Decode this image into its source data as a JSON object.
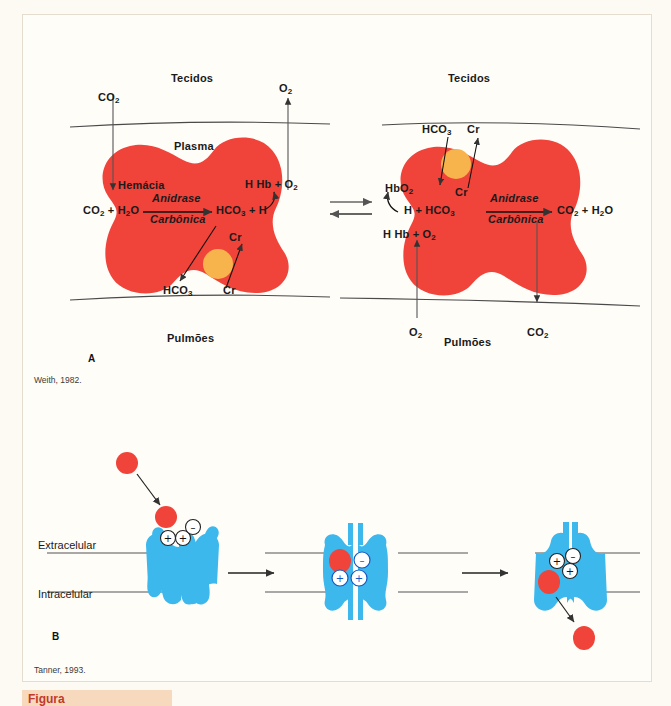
{
  "figure": {
    "background_color": "#fdfaf4",
    "panel_background": "#fffdf8",
    "rbc_color": "#f0433a",
    "band3_color": "#3db8ed",
    "carrier_color": "#f8b44c",
    "line_color": "#4a4a4a"
  },
  "panel_a": {
    "letter": "A",
    "source": "Weith, 1982.",
    "left": {
      "top_compartment": "Tecidos",
      "bottom_compartment": "Pulmões",
      "plasma_label": "Plasma",
      "cell_label": "Hemácia",
      "in_gas": "CO",
      "in_gas_sub": "2",
      "out_gas": "O",
      "out_gas_sub": "2",
      "reaction_left": "CO2 + H2O",
      "reaction_right": "HCO3 + H",
      "enzyme_top": "Anidrase",
      "enzyme_bottom": "Carbônica",
      "hb_reaction": "H Hb + O2",
      "exchange_out": "HCO3",
      "exchange_in": "Cr",
      "exchange_out_inner": "HCO3",
      "exchange_in_inner": "Cr"
    },
    "right": {
      "top_compartment": "Tecidos",
      "bottom_compartment": "Pulmões",
      "in_ion": "HCO3",
      "out_ion": "Cr",
      "inner_ion": "Cr",
      "hbo2": "HbO2",
      "reaction_left": "H + HCO3",
      "reaction_right": "CO2 + H2O",
      "enzyme_top": "Anidrase",
      "enzyme_bottom": "Carbônica",
      "hb_reaction": "H Hb + O2",
      "bottom_o2": "O2",
      "bottom_co2": "CO2"
    },
    "equilibrium_arrows": "bidirectional"
  },
  "panel_b": {
    "letter": "B",
    "source": "Tanner, 1993.",
    "membrane_top_label": "Extracelular",
    "membrane_bottom_label": "Intracelular",
    "states": [
      {
        "name": "open-outward",
        "charges": [
          "+",
          "+",
          "-"
        ],
        "ion_position": "extracellular-entry"
      },
      {
        "name": "occluded",
        "charges": [
          "-",
          "+",
          "+"
        ],
        "ion_position": "bound-inside"
      },
      {
        "name": "open-inward",
        "charges": [
          "+",
          "-",
          "+"
        ],
        "ion_position": "intracellular-release"
      }
    ],
    "transition_arrows": 2
  },
  "caption_bar": {
    "text": "Figura"
  }
}
